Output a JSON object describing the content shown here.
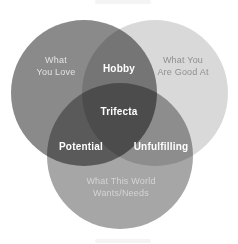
{
  "venn": {
    "type": "venn-diagram",
    "background_color": "#ffffff",
    "circles": [
      {
        "name": "what-you-love",
        "label": "What\nYou Love",
        "fill_color": "#8a8a8a",
        "text_color": "#e2e2e2"
      },
      {
        "name": "what-you-are-good-at",
        "label": "What You\nAre Good At",
        "fill_color": "#d9d9d9",
        "text_color": "#8f8f8f"
      },
      {
        "name": "what-this-world-wants-needs",
        "label": "What This World\nWants/Needs",
        "fill_color": "#a6a6a6",
        "text_color": "#d4d4d4"
      }
    ],
    "intersections": [
      {
        "name": "hobby",
        "label": "Hobby",
        "between": [
          "what-you-love",
          "what-you-are-good-at"
        ],
        "fill_color": "#757575",
        "text_color": "#ffffff"
      },
      {
        "name": "potential",
        "label": "Potential",
        "between": [
          "what-you-love",
          "what-this-world-wants-needs"
        ],
        "fill_color": "#5a5a5a",
        "text_color": "#ffffff"
      },
      {
        "name": "unfulfilling",
        "label": "Unfulfilling",
        "between": [
          "what-you-are-good-at",
          "what-this-world-wants-needs"
        ],
        "fill_color": "#999999",
        "text_color": "#ffffff"
      },
      {
        "name": "trifecta",
        "label": "Trifecta",
        "between": [
          "what-you-love",
          "what-you-are-good-at",
          "what-this-world-wants-needs"
        ],
        "fill_color": "#4c4c4c",
        "text_color": "#ffffff"
      }
    ]
  }
}
